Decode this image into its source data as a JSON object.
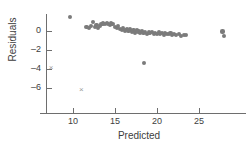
{
  "chart_data": {
    "type": "scatter",
    "title": "",
    "xlabel": "Predicted",
    "ylabel": "Residuals",
    "xlim": [
      7.0,
      29.0
    ],
    "ylim": [
      -7.0,
      2.2
    ],
    "grid": false,
    "legend": null,
    "xticks": [
      10,
      15,
      20,
      25
    ],
    "xtick_labels": [
      "10",
      "15",
      "20",
      "25"
    ],
    "yticks": [
      0,
      -2,
      -4,
      -6
    ],
    "ytick_labels": [
      "0",
      "–2",
      "–4",
      "–6"
    ],
    "series": [
      {
        "name": "residuals",
        "marker": "filled-circle",
        "color": "#7b7b7b",
        "points": [
          [
            9.6,
            1.45
          ],
          [
            11.6,
            0.45
          ],
          [
            11.9,
            0.35
          ],
          [
            12.1,
            0.55
          ],
          [
            12.4,
            0.95
          ],
          [
            12.6,
            0.45
          ],
          [
            12.8,
            0.6
          ],
          [
            13.0,
            0.35
          ],
          [
            13.2,
            0.5
          ],
          [
            13.4,
            0.75
          ],
          [
            13.6,
            0.8
          ],
          [
            13.8,
            0.7
          ],
          [
            14.0,
            0.85
          ],
          [
            14.2,
            0.75
          ],
          [
            14.4,
            0.65
          ],
          [
            14.5,
            0.8
          ],
          [
            14.7,
            0.7
          ],
          [
            15.0,
            0.45
          ],
          [
            15.2,
            0.3
          ],
          [
            15.4,
            0.55
          ],
          [
            15.6,
            0.25
          ],
          [
            15.8,
            0.1
          ],
          [
            16.0,
            0.3
          ],
          [
            16.2,
            0.05
          ],
          [
            16.4,
            0.2
          ],
          [
            16.6,
            0.0
          ],
          [
            16.8,
            0.15
          ],
          [
            17.0,
            -0.1
          ],
          [
            17.2,
            0.05
          ],
          [
            17.4,
            -0.15
          ],
          [
            17.6,
            0.1
          ],
          [
            17.8,
            -0.05
          ],
          [
            18.0,
            -0.2
          ],
          [
            18.2,
            0.0
          ],
          [
            18.4,
            -0.25
          ],
          [
            18.6,
            -0.1
          ],
          [
            18.8,
            -0.3
          ],
          [
            19.0,
            -0.15
          ],
          [
            19.2,
            -0.25
          ],
          [
            19.4,
            -0.1
          ],
          [
            19.6,
            -0.3
          ],
          [
            19.8,
            -0.2
          ],
          [
            20.0,
            -0.35
          ],
          [
            20.2,
            -0.15
          ],
          [
            20.4,
            -0.3
          ],
          [
            20.6,
            -0.25
          ],
          [
            20.8,
            -0.4
          ],
          [
            21.0,
            -0.2
          ],
          [
            21.2,
            -0.35
          ],
          [
            21.4,
            -0.3
          ],
          [
            21.6,
            -0.25
          ],
          [
            21.8,
            -0.4
          ],
          [
            22.0,
            -0.3
          ],
          [
            22.3,
            -0.45
          ],
          [
            22.6,
            -0.35
          ],
          [
            22.9,
            -0.5
          ],
          [
            23.2,
            -0.4
          ],
          [
            23.5,
            -0.45
          ],
          [
            18.5,
            -3.4
          ],
          [
            27.8,
            -0.05
          ],
          [
            28.0,
            -0.55
          ]
        ]
      },
      {
        "name": "excluded-outliers",
        "marker": "x-cross",
        "color": "#9a9a9a",
        "points": [
          [
            7.4,
            -3.95
          ],
          [
            11.0,
            -6.2
          ]
        ]
      }
    ]
  },
  "axes": {
    "x_title": "Predicted",
    "y_title": "Residuals"
  },
  "colors": {
    "point": "#7b7b7b",
    "cross": "#9a9a9a",
    "axis": "#6e6e6e",
    "text": "#3d3d3d",
    "background": "#ffffff"
  }
}
